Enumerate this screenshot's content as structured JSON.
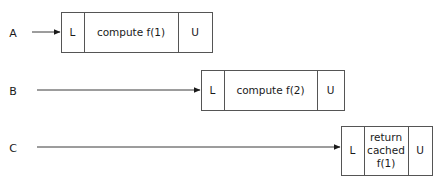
{
  "diagram": {
    "type": "sequence-timeline",
    "title": "",
    "background_color": "#ffffff",
    "line_color": "#555555",
    "text_color": "#1a1a1a",
    "lanes": [
      {
        "id": "A",
        "label": "A",
        "label_x": 13,
        "label_y": 37,
        "arrow": {
          "x1": 32,
          "x2": 61,
          "y": 32
        },
        "box": {
          "x": 61,
          "y": 12,
          "width": 151,
          "height": 40,
          "cells": [
            {
              "name": "lock",
              "label": "L",
              "width": 23,
              "lines": [
                "L"
              ]
            },
            {
              "name": "body",
              "label": "compute f(1)",
              "width": 94,
              "lines": [
                "compute f(1)"
              ]
            },
            {
              "name": "unlock",
              "label": "U",
              "width": 34,
              "lines": [
                "U"
              ]
            }
          ]
        }
      },
      {
        "id": "B",
        "label": "B",
        "label_x": 13,
        "label_y": 95,
        "arrow": {
          "x1": 37,
          "x2": 201,
          "y": 90
        },
        "box": {
          "x": 201,
          "y": 70,
          "width": 143,
          "height": 40,
          "cells": [
            {
              "name": "lock",
              "label": "L",
              "width": 23,
              "lines": [
                "L"
              ]
            },
            {
              "name": "body",
              "label": "compute f(2)",
              "width": 93,
              "lines": [
                "compute f(2)"
              ]
            },
            {
              "name": "unlock",
              "label": "U",
              "width": 27,
              "lines": [
                "U"
              ]
            }
          ]
        }
      },
      {
        "id": "C",
        "label": "C",
        "label_x": 13,
        "label_y": 152,
        "arrow": {
          "x1": 37,
          "x2": 341,
          "y": 147
        },
        "box": {
          "x": 341,
          "y": 126,
          "width": 91,
          "height": 49,
          "cells": [
            {
              "name": "lock",
              "label": "L",
              "width": 23,
              "lines": [
                "L"
              ]
            },
            {
              "name": "body",
              "label": "return cached f(1)",
              "width": 44,
              "lines": [
                "return",
                "cached",
                "f(1)"
              ]
            },
            {
              "name": "unlock",
              "label": "U",
              "width": 24,
              "lines": [
                "U"
              ]
            }
          ]
        }
      }
    ]
  }
}
